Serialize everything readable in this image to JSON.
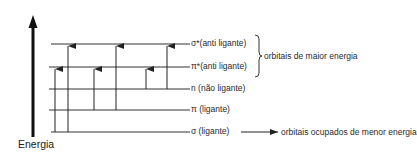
{
  "axis": {
    "label": "Energia"
  },
  "levels": [
    {
      "symbol": "σ*",
      "label": "σ*(anti ligante)",
      "y": 44
    },
    {
      "symbol": "π*",
      "label": "π*(anti ligante)",
      "y": 67
    },
    {
      "symbol": "n",
      "label": "n  (não ligante)",
      "y": 89
    },
    {
      "symbol": "π",
      "label": "π (ligante)",
      "y": 110
    },
    {
      "symbol": "σ",
      "label": "σ (ligante)",
      "y": 132
    }
  ],
  "transitions": [
    {
      "from": "σ",
      "to": "π*",
      "x": 55
    },
    {
      "from": "σ",
      "to": "σ*",
      "x": 68
    },
    {
      "from": "π",
      "to": "π*",
      "x": 94
    },
    {
      "from": "π",
      "to": "σ*",
      "x": 116
    },
    {
      "from": "n",
      "to": "π*",
      "x": 146
    },
    {
      "from": "n",
      "to": "σ*",
      "x": 167
    }
  ],
  "annotations": {
    "upper": "orbitais de maior energia",
    "lower": "orbitais ocupados de menor energia"
  },
  "colors": {
    "line": "#333333",
    "axis": "#111111"
  }
}
